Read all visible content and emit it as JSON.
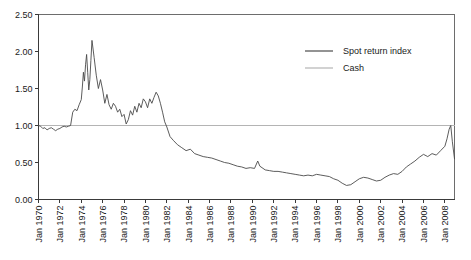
{
  "chart_data": {
    "type": "line",
    "title": "",
    "xlabel": "",
    "ylabel": "",
    "ylim": [
      0.0,
      2.5
    ],
    "ytick_values": [
      0.0,
      0.5,
      1.0,
      1.5,
      2.0,
      2.5
    ],
    "ytick_labels": [
      "0.00",
      "0.50",
      "1.00",
      "1.50",
      "2.00",
      "2.50"
    ],
    "xlim": [
      1970.0,
      2008.9
    ],
    "xtick_values": [
      1970,
      1972,
      1974,
      1976,
      1978,
      1980,
      1982,
      1984,
      1986,
      1988,
      1990,
      1992,
      1994,
      1996,
      1998,
      2000,
      2002,
      2004,
      2006,
      2008
    ],
    "xtick_labels": [
      "Jan 1970",
      "Jan 1972",
      "Jan 1974",
      "Jan 1976",
      "Jan 1978",
      "Jan 1980",
      "Jan 1982",
      "Jan 1984",
      "Jan 1986",
      "Jan 1988",
      "Jan 1990",
      "Jan 1992",
      "Jan 1994",
      "Jan 1996",
      "Jan 1998",
      "Jan 2000",
      "Jan 2002",
      "Jan 2004",
      "Jan 2006",
      "Jan 2008"
    ],
    "xtick_rotation": 90,
    "grid": false,
    "legend_position": "top-right",
    "colors": {
      "spot_return_index": "#4a4a4a",
      "cash": "#b4b4b4",
      "axis": "#3a3a3a",
      "frame": "#6d6d6d",
      "text": "#1a1a1a",
      "background": "#ffffff"
    },
    "series": [
      {
        "name": "Spot return index",
        "color": "#4a4a4a",
        "x": [
          1970.0,
          1970.2,
          1970.4,
          1970.6,
          1970.8,
          1971.0,
          1971.2,
          1971.4,
          1971.6,
          1971.8,
          1972.0,
          1972.2,
          1972.4,
          1972.6,
          1972.8,
          1973.0,
          1973.2,
          1973.4,
          1973.6,
          1973.8,
          1974.0,
          1974.1,
          1974.2,
          1974.3,
          1974.4,
          1974.5,
          1974.6,
          1974.7,
          1974.8,
          1974.9,
          1975.0,
          1975.2,
          1975.4,
          1975.6,
          1975.8,
          1976.0,
          1976.2,
          1976.4,
          1976.6,
          1976.8,
          1977.0,
          1977.2,
          1977.4,
          1977.6,
          1977.8,
          1978.0,
          1978.2,
          1978.4,
          1978.6,
          1978.8,
          1979.0,
          1979.2,
          1979.4,
          1979.6,
          1979.8,
          1980.0,
          1980.2,
          1980.4,
          1980.6,
          1980.8,
          1981.0,
          1981.2,
          1981.4,
          1981.6,
          1981.8,
          1982.0,
          1982.3,
          1982.6,
          1983.0,
          1983.4,
          1983.8,
          1984.2,
          1984.6,
          1985.0,
          1985.4,
          1985.8,
          1986.2,
          1986.6,
          1987.0,
          1987.4,
          1987.8,
          1988.2,
          1988.6,
          1989.0,
          1989.4,
          1989.8,
          1990.2,
          1990.5,
          1990.7,
          1990.9,
          1991.2,
          1991.6,
          1992.0,
          1992.4,
          1992.8,
          1993.2,
          1993.6,
          1994.0,
          1994.4,
          1994.8,
          1995.2,
          1995.6,
          1996.0,
          1996.4,
          1996.8,
          1997.2,
          1997.6,
          1998.0,
          1998.4,
          1998.8,
          1999.2,
          1999.6,
          2000.0,
          2000.4,
          2000.8,
          2001.2,
          2001.6,
          2002.0,
          2002.4,
          2002.8,
          2003.2,
          2003.6,
          2004.0,
          2004.4,
          2004.8,
          2005.2,
          2005.6,
          2006.0,
          2006.4,
          2006.8,
          2007.2,
          2007.6,
          2008.0,
          2008.2,
          2008.4,
          2008.55,
          2008.7,
          2008.9
        ],
        "values": [
          1.0,
          0.99,
          0.96,
          0.97,
          0.94,
          0.96,
          0.97,
          0.95,
          0.93,
          0.95,
          0.96,
          0.98,
          0.99,
          0.98,
          0.99,
          1.0,
          1.18,
          1.22,
          1.2,
          1.28,
          1.35,
          1.52,
          1.72,
          1.6,
          1.82,
          1.96,
          1.72,
          1.48,
          1.62,
          1.88,
          2.15,
          1.92,
          1.68,
          1.5,
          1.62,
          1.48,
          1.3,
          1.42,
          1.28,
          1.22,
          1.3,
          1.26,
          1.18,
          1.22,
          1.12,
          1.15,
          1.02,
          1.08,
          1.2,
          1.14,
          1.26,
          1.18,
          1.3,
          1.24,
          1.36,
          1.32,
          1.24,
          1.36,
          1.3,
          1.38,
          1.45,
          1.4,
          1.3,
          1.18,
          1.05,
          0.98,
          0.85,
          0.8,
          0.74,
          0.7,
          0.66,
          0.68,
          0.62,
          0.6,
          0.58,
          0.57,
          0.56,
          0.54,
          0.52,
          0.5,
          0.49,
          0.47,
          0.45,
          0.44,
          0.42,
          0.43,
          0.42,
          0.52,
          0.45,
          0.43,
          0.4,
          0.39,
          0.38,
          0.38,
          0.37,
          0.36,
          0.35,
          0.34,
          0.33,
          0.32,
          0.33,
          0.32,
          0.34,
          0.33,
          0.32,
          0.31,
          0.28,
          0.26,
          0.22,
          0.19,
          0.2,
          0.24,
          0.28,
          0.3,
          0.29,
          0.27,
          0.25,
          0.26,
          0.3,
          0.33,
          0.35,
          0.34,
          0.38,
          0.44,
          0.48,
          0.52,
          0.57,
          0.61,
          0.58,
          0.62,
          0.6,
          0.66,
          0.72,
          0.82,
          0.95,
          1.0,
          0.78,
          0.55
        ]
      },
      {
        "name": "Cash",
        "color": "#b4b4b4",
        "x": [
          1970.0,
          2008.9
        ],
        "values": [
          1.0,
          1.0
        ]
      }
    ],
    "legend": [
      {
        "label": "Spot return index",
        "color": "#4a4a4a"
      },
      {
        "label": "Cash",
        "color": "#b4b4b4"
      }
    ]
  }
}
